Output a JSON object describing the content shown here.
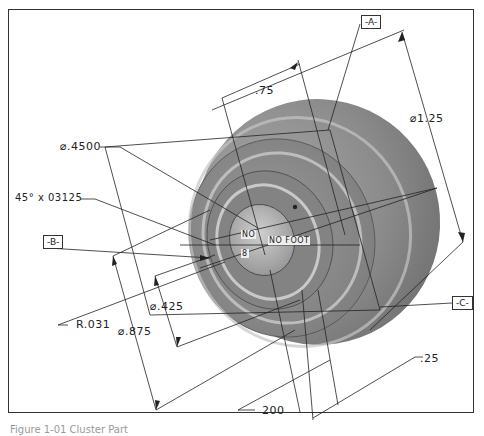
{
  "drawing": {
    "type": "isometric-engineering-drawing",
    "subject": "cylindrical part with counterbore",
    "colors": {
      "line": "#222222",
      "part_dark": "#6a6a6a",
      "part_mid": "#8c8c8c",
      "part_light": "#b5b5b5",
      "frame": "#333333",
      "background": "#ffffff"
    }
  },
  "datums": {
    "a": "-A-",
    "b": "-B-",
    "c": "-C-"
  },
  "dimensions": {
    "dia_4500": "⌀.4500",
    "chamfer": "45° x 03125",
    "radius": "R.031",
    "dia_425": "⌀.425",
    "dia_875": "⌀.875",
    "length_75": ".75",
    "dia_125": "⌀1.25",
    "length_25": ".25",
    "length_200": "200"
  },
  "center_labels": {
    "label_1": "NO",
    "label_2": "NO FOOT",
    "label_3": "8"
  },
  "caption": {
    "text": "Figure 1-01 Cluster Part"
  }
}
